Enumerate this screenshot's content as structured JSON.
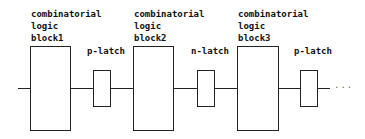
{
  "diagram": {
    "blocks": [
      {
        "line1": "combinatorial",
        "line2": "logic",
        "line3": "block1"
      },
      {
        "line1": "combinatorial",
        "line2": "logic",
        "line3": "block2"
      },
      {
        "line1": "combinatorial",
        "line2": "logic",
        "line3": "block3"
      }
    ],
    "latches": [
      {
        "label": "p-latch"
      },
      {
        "label": "n-latch"
      },
      {
        "label": "p-latch"
      }
    ],
    "continuation": "...",
    "colors": {
      "stroke": "#222222",
      "background": "#ffffff"
    }
  }
}
